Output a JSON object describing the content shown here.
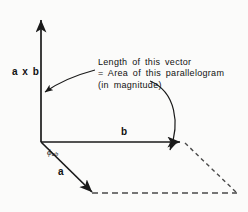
{
  "figure": {
    "stroke_color": "#1a1a1a",
    "background_color": "#fbfbfa",
    "labels": {
      "cross_product": "a x b",
      "vector_b": "b",
      "vector_a": "a",
      "angle_phi": "ϕ",
      "angle_subscript": "ab"
    },
    "annotation": {
      "line1": "Length of this vector",
      "line2": "= Area of this parallelogram",
      "line3": "(in magnitude)"
    },
    "icons": {
      "arrow_cross": "arrow-up-icon",
      "arrow_b": "arrow-right-icon",
      "arrow_a": "arrow-down-right-icon",
      "pointer_to_cross": "callout-arrow-icon",
      "pointer_to_parallelogram": "curved-callout-arrow-icon"
    }
  }
}
